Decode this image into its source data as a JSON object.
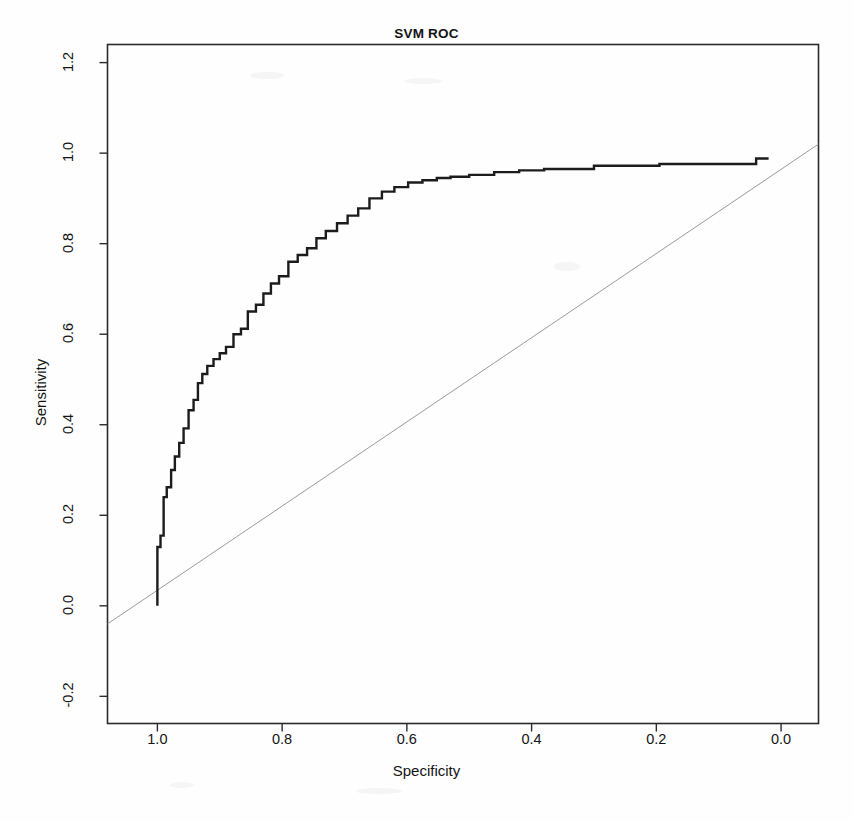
{
  "chart_data": {
    "type": "line",
    "title": "SVM ROC",
    "xlabel": "Specificity",
    "ylabel": "Sensitivity",
    "xlim": [
      1.08,
      -0.06
    ],
    "ylim": [
      -0.26,
      1.24
    ],
    "x_reversed": true,
    "grid": false,
    "legend": "none",
    "xticks": [
      "1.0",
      "0.8",
      "0.6",
      "0.4",
      "0.2",
      "0.0"
    ],
    "xtick_values": [
      1.0,
      0.8,
      0.6,
      0.4,
      0.2,
      0.0
    ],
    "yticks": [
      "-0.2",
      "0.0",
      "0.2",
      "0.4",
      "0.6",
      "0.8",
      "1.0",
      "1.2"
    ],
    "ytick_values": [
      -0.2,
      0.0,
      0.2,
      0.4,
      0.6,
      0.8,
      1.0,
      1.2
    ],
    "series": [
      {
        "name": "ROC curve",
        "style": "step",
        "color": "#1c1c1c",
        "linewidth": 2.4,
        "specificity": [
          1.0,
          1.0,
          0.995,
          0.995,
          0.99,
          0.99,
          0.985,
          0.985,
          0.978,
          0.978,
          0.972,
          0.972,
          0.965,
          0.965,
          0.958,
          0.958,
          0.95,
          0.95,
          0.942,
          0.942,
          0.935,
          0.935,
          0.928,
          0.928,
          0.92,
          0.92,
          0.91,
          0.91,
          0.9,
          0.9,
          0.89,
          0.89,
          0.878,
          0.878,
          0.866,
          0.866,
          0.855,
          0.855,
          0.842,
          0.842,
          0.83,
          0.83,
          0.818,
          0.818,
          0.805,
          0.805,
          0.79,
          0.79,
          0.775,
          0.775,
          0.76,
          0.76,
          0.745,
          0.745,
          0.73,
          0.73,
          0.712,
          0.712,
          0.695,
          0.695,
          0.678,
          0.678,
          0.66,
          0.66,
          0.64,
          0.64,
          0.62,
          0.62,
          0.598,
          0.598,
          0.575,
          0.575,
          0.552,
          0.552,
          0.53,
          0.53,
          0.5,
          0.5,
          0.46,
          0.46,
          0.42,
          0.42,
          0.38,
          0.38,
          0.3,
          0.3,
          0.195,
          0.195,
          0.04,
          0.04,
          0.02
        ],
        "sensitivity": [
          0.0,
          0.13,
          0.13,
          0.155,
          0.155,
          0.24,
          0.24,
          0.262,
          0.262,
          0.3,
          0.3,
          0.33,
          0.33,
          0.36,
          0.36,
          0.392,
          0.392,
          0.432,
          0.432,
          0.455,
          0.455,
          0.492,
          0.492,
          0.512,
          0.512,
          0.53,
          0.53,
          0.545,
          0.545,
          0.558,
          0.558,
          0.572,
          0.572,
          0.6,
          0.6,
          0.612,
          0.612,
          0.65,
          0.65,
          0.665,
          0.665,
          0.69,
          0.69,
          0.712,
          0.712,
          0.728,
          0.728,
          0.76,
          0.76,
          0.775,
          0.775,
          0.79,
          0.79,
          0.812,
          0.812,
          0.828,
          0.828,
          0.845,
          0.845,
          0.862,
          0.862,
          0.878,
          0.878,
          0.9,
          0.9,
          0.915,
          0.915,
          0.925,
          0.925,
          0.935,
          0.935,
          0.94,
          0.94,
          0.945,
          0.945,
          0.948,
          0.948,
          0.952,
          0.952,
          0.958,
          0.958,
          0.962,
          0.962,
          0.965,
          0.965,
          0.972,
          0.972,
          0.976,
          0.976,
          0.988,
          0.988
        ]
      },
      {
        "name": "chance diagonal",
        "style": "line",
        "color": "#9a9a9a",
        "linewidth": 1.0,
        "specificity": [
          1.08,
          -0.06
        ],
        "sensitivity": [
          -0.04,
          1.02
        ]
      }
    ]
  },
  "figure": {
    "title": "SVM ROC",
    "xlabel": "Specificity",
    "ylabel": "Sensitivity"
  }
}
